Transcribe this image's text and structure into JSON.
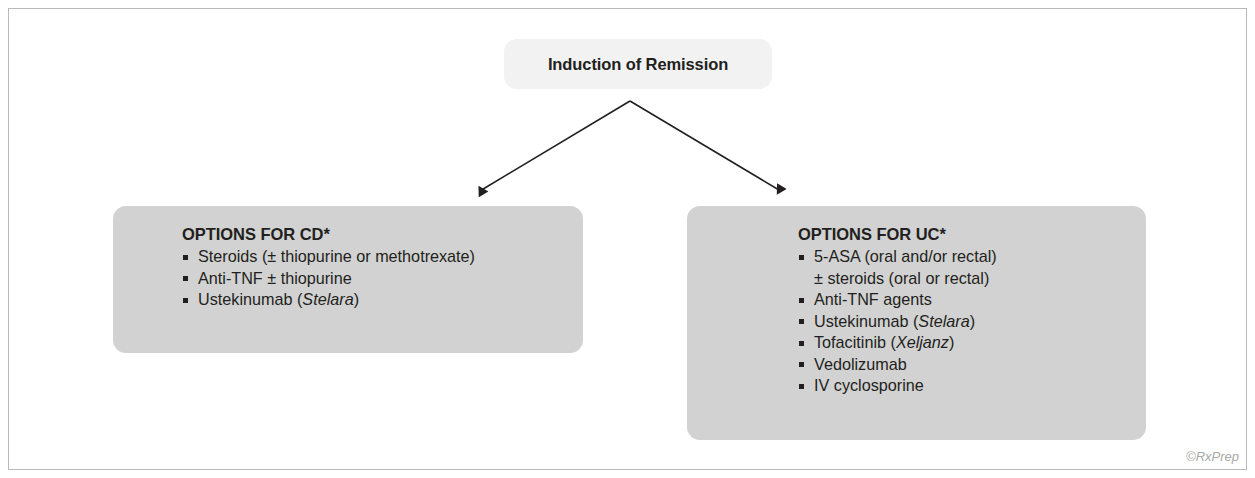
{
  "figure": {
    "root": {
      "title": "Induction of Remission"
    },
    "branches": [
      {
        "id": "cd",
        "heading": "OPTIONS FOR CD*",
        "items": [
          {
            "text": "Steroids (± thiopurine or methotrexate)",
            "bullet": true
          },
          {
            "text": "Anti-TNF ± thiopurine",
            "bullet": true
          },
          {
            "text": "Ustekinumab (",
            "bullet": true,
            "brand": "Stelara",
            "tail": ")"
          }
        ]
      },
      {
        "id": "uc",
        "heading": "OPTIONS FOR UC*",
        "items": [
          {
            "text": "5-ASA (oral and/or rectal)",
            "bullet": true
          },
          {
            "text": "± steroids (oral or rectal)",
            "bullet": false
          },
          {
            "text": "Anti-TNF agents",
            "bullet": true
          },
          {
            "text": "Ustekinumab (",
            "bullet": true,
            "brand": "Stelara",
            "tail": ")"
          },
          {
            "text": "Tofacitinib (",
            "bullet": true,
            "brand": "Xeljanz",
            "tail": ")"
          },
          {
            "text": "Vedolizumab",
            "bullet": true
          },
          {
            "text": "IV cyclosporine",
            "bullet": true
          }
        ]
      }
    ],
    "credit": "©RxPrep",
    "colors": {
      "box_fill": "#d2d2d2",
      "root_fill": "#f2f2f2",
      "text": "#231f20",
      "frame_border": "#b9b9b9",
      "credit_text": "#a8a8a8",
      "connector": "#231f20"
    },
    "connectors": {
      "apex_x": 630,
      "apex_y": 101,
      "left_target_x": 479,
      "left_target_y": 196,
      "right_target_x": 781,
      "right_target_y": 196
    }
  }
}
